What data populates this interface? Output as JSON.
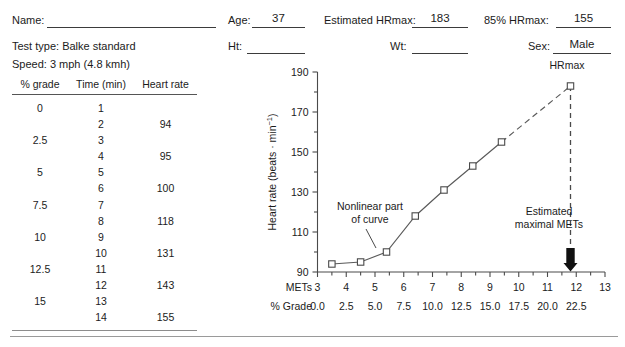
{
  "form": {
    "name_label": "Name:",
    "name_value": "",
    "test_type": "Test type: Balke standard",
    "speed": "Speed: 3 mph (4.8 kmh)",
    "age_label": "Age:",
    "age_value": "37",
    "ht_label": "Ht:",
    "ht_value": "",
    "hrmax_label": "Estimated HRmax:",
    "hrmax_value": "183",
    "wt_label": "Wt:",
    "wt_value": "",
    "pct85_label": "85% HRmax:",
    "pct85_value": "155",
    "sex_label": "Sex:",
    "sex_value": "Male"
  },
  "table": {
    "headers": [
      "% grade",
      "Time (min)",
      "Heart rate"
    ],
    "rows": [
      [
        "0",
        "1",
        ""
      ],
      [
        "",
        "2",
        "94"
      ],
      [
        "2.5",
        "3",
        ""
      ],
      [
        "",
        "4",
        "95"
      ],
      [
        "5",
        "5",
        ""
      ],
      [
        "",
        "6",
        "100"
      ],
      [
        "7.5",
        "7",
        ""
      ],
      [
        "",
        "8",
        "118"
      ],
      [
        "10",
        "9",
        ""
      ],
      [
        "",
        "10",
        "131"
      ],
      [
        "12.5",
        "11",
        ""
      ],
      [
        "",
        "12",
        "143"
      ],
      [
        "15",
        "13",
        ""
      ],
      [
        "",
        "14",
        "155"
      ]
    ]
  },
  "chart_data": {
    "type": "line",
    "title": "",
    "xlabel": "METs",
    "xlabel2": "% Grade",
    "ylabel": "Heart rate (beats · min",
    "ylabel_sup": "−1",
    "ylabel_close": ")",
    "xlim": [
      3,
      13
    ],
    "ylim": [
      90,
      190
    ],
    "xticks": [
      3,
      4,
      5,
      6,
      7,
      8,
      9,
      10,
      11,
      12,
      13
    ],
    "xticklabels": [
      "3",
      "4",
      "5",
      "6",
      "7",
      "8",
      "9",
      "10",
      "11",
      "12",
      "13"
    ],
    "grade_ticklabels": [
      "0.0",
      "2.5",
      "5.0",
      "7.5",
      "10.0",
      "12.5",
      "15.0",
      "17.5",
      "20.0",
      "22.5"
    ],
    "grade_tickvalues": [
      3,
      4,
      5,
      6,
      7,
      8,
      9,
      10,
      11,
      12
    ],
    "yticks": [
      90,
      110,
      130,
      150,
      170,
      190
    ],
    "yticklabels": [
      "90",
      "110",
      "130",
      "150",
      "170",
      "190"
    ],
    "yminorticks": [
      100,
      120,
      140,
      160,
      180
    ],
    "grid": false,
    "legend": "none",
    "series": [
      {
        "name": "Measured heart rate",
        "x": [
          3.5,
          4.5,
          5.4,
          6.4,
          7.4,
          8.4,
          9.4,
          10.4
        ],
        "y": [
          94,
          95,
          100,
          118,
          131,
          143,
          155,
          183
        ],
        "marker": "square-open"
      }
    ],
    "extrapolation": {
      "name": "Extrapolated to estimated HRmax",
      "from": [
        9.4,
        155
      ],
      "to": [
        11.8,
        183
      ],
      "style": "dashed"
    },
    "annotations": [
      {
        "name": "nonlinear-part",
        "text_lines": [
          "Nonlinear part",
          "of curve"
        ],
        "points_to": [
          5.4,
          100
        ]
      },
      {
        "name": "estimated-hrmax",
        "text_lines": [
          "Estimated",
          "HRmax"
        ],
        "points_to": [
          11.8,
          183
        ]
      },
      {
        "name": "estimated-maximal-mets",
        "text_lines": [
          "Estimated",
          "maximal METs"
        ],
        "points_to": [
          11.8,
          90
        ]
      }
    ],
    "vertical_marker": {
      "x": 11.8,
      "from_y": 183,
      "to_y": 90,
      "arrow": "down"
    }
  }
}
